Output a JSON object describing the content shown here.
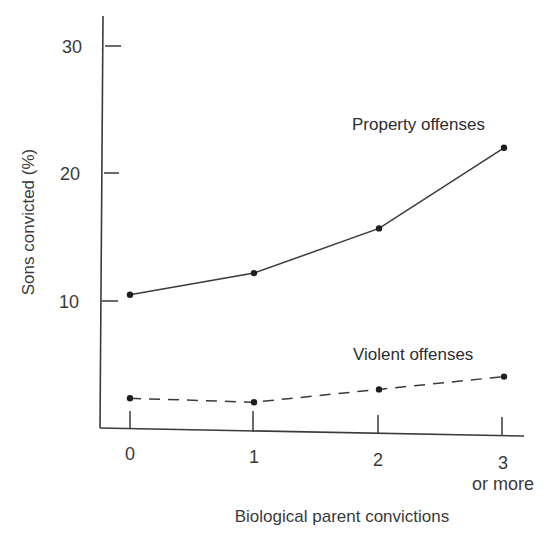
{
  "chart_data": {
    "type": "line",
    "title": "",
    "xlabel": "Biological parent convictions",
    "ylabel": "Sons convicted (%)",
    "categories": [
      "0",
      "1",
      "2",
      "3 or more"
    ],
    "category_labels": [
      {
        "main": "0",
        "sub": ""
      },
      {
        "main": "1",
        "sub": ""
      },
      {
        "main": "2",
        "sub": ""
      },
      {
        "main": "3",
        "sub": "or more"
      }
    ],
    "yticks": [
      10,
      20,
      30
    ],
    "ylim": [
      0,
      32
    ],
    "grid": false,
    "legend": "inline labels near series ends",
    "series": [
      {
        "name": "Property offenses",
        "style": "solid",
        "values": [
          10.5,
          12.2,
          15.7,
          22.0
        ]
      },
      {
        "name": "Violent offenses",
        "style": "dashed",
        "values": [
          2.4,
          2.1,
          3.1,
          4.1
        ]
      }
    ]
  },
  "colors": {
    "line": "#3a3a3a",
    "text": "#3a3a3a",
    "background": "#ffffff"
  }
}
